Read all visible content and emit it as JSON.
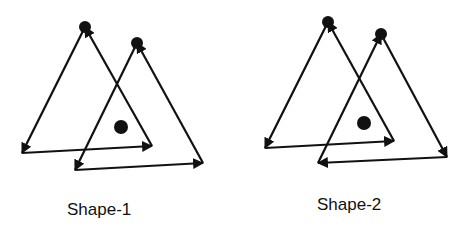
{
  "colors": {
    "stroke": "#111111",
    "background": "#ffffff"
  },
  "shapes": [
    {
      "label": "Shape-1",
      "triangles": [
        {
          "apex": [
            85,
            27
          ],
          "bottom_left": [
            22,
            153
          ],
          "bottom_right": [
            152,
            146
          ],
          "edges": [
            {
              "from": "apex",
              "to": "bottom_left"
            },
            {
              "from": "bottom_left",
              "to": "bottom_right"
            },
            {
              "from": "bottom_right",
              "to": "apex"
            }
          ],
          "apex_dot": true
        },
        {
          "apex": [
            137,
            43
          ],
          "bottom_left": [
            75,
            170
          ],
          "bottom_right": [
            203,
            163
          ],
          "edges": [
            {
              "from": "apex",
              "to": "bottom_left"
            },
            {
              "from": "bottom_left",
              "to": "bottom_right"
            },
            {
              "from": "bottom_right",
              "to": "apex"
            }
          ],
          "apex_dot": true
        }
      ],
      "center_dot": [
        121,
        127
      ]
    },
    {
      "label": "Shape-2",
      "triangles": [
        {
          "apex": [
            328,
            22
          ],
          "bottom_left": [
            265,
            148
          ],
          "bottom_right": [
            394,
            141
          ],
          "edges": [
            {
              "from": "apex",
              "to": "bottom_left"
            },
            {
              "from": "bottom_left",
              "to": "bottom_right"
            },
            {
              "from": "bottom_right",
              "to": "apex"
            }
          ],
          "apex_dot": true
        },
        {
          "apex": [
            381,
            34
          ],
          "bottom_left": [
            318,
            163
          ],
          "bottom_right": [
            447,
            157
          ],
          "edges": [
            {
              "from": "bottom_left",
              "to": "apex"
            },
            {
              "from": "apex",
              "to": "bottom_right"
            },
            {
              "from": "bottom_right",
              "to": "bottom_left"
            }
          ],
          "apex_dot": true
        }
      ],
      "center_dot": [
        364,
        123
      ]
    }
  ]
}
